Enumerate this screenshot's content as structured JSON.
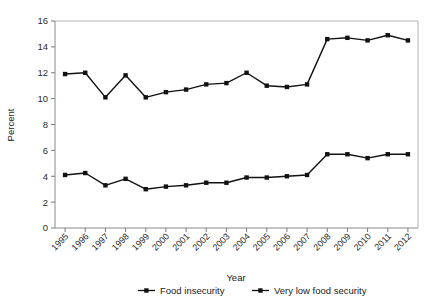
{
  "chart_data": {
    "type": "line",
    "title": "",
    "xlabel": "Year",
    "ylabel": "Percent",
    "ylim": [
      0,
      16
    ],
    "ytick_step": 2,
    "yticks": [
      0,
      2,
      4,
      6,
      8,
      10,
      12,
      14,
      16
    ],
    "grid": false,
    "legend_position": "bottom",
    "categories": [
      "1995",
      "1996",
      "1997",
      "1998",
      "1999",
      "2000",
      "2001",
      "2002",
      "2003",
      "2004",
      "2005",
      "2006",
      "2007",
      "2008",
      "2009",
      "2010",
      "2011",
      "2012"
    ],
    "x": [
      1995,
      1996,
      1997,
      1998,
      1999,
      2000,
      2001,
      2002,
      2003,
      2004,
      2005,
      2006,
      2007,
      2008,
      2009,
      2010,
      2011,
      2012
    ],
    "series": [
      {
        "name": "Food insecurity",
        "marker": "square",
        "color": "#111111",
        "values": [
          11.9,
          12.0,
          10.1,
          11.8,
          10.1,
          10.5,
          10.7,
          11.1,
          11.2,
          12.0,
          11.0,
          10.9,
          11.1,
          14.6,
          14.7,
          14.5,
          14.9,
          14.5
        ]
      },
      {
        "name": "Very low food security",
        "marker": "square",
        "color": "#111111",
        "values": [
          4.1,
          4.25,
          3.3,
          3.8,
          3.0,
          3.2,
          3.3,
          3.5,
          3.5,
          3.9,
          3.9,
          4.0,
          4.1,
          5.7,
          5.7,
          5.4,
          5.7,
          5.7
        ]
      }
    ]
  },
  "legend": {
    "items": [
      {
        "label": "Food insecurity"
      },
      {
        "label": "Very low food security"
      }
    ]
  }
}
